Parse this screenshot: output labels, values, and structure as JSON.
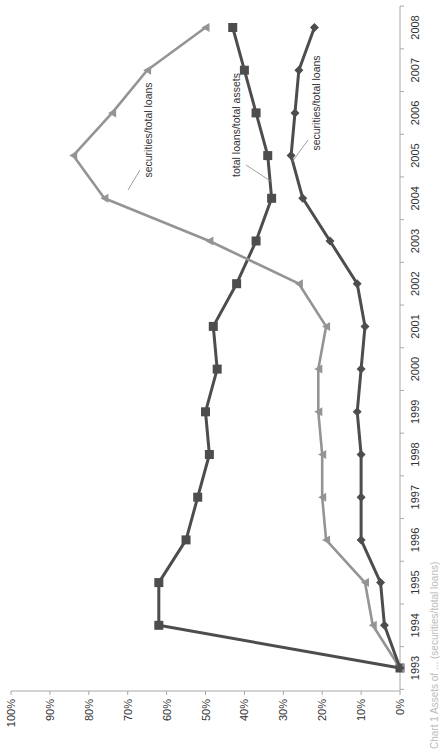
{
  "chart_data": {
    "type": "line",
    "orientation": "rotated 90 degrees counterclockwise (value axis horizontal along bottom, 0% at right; years run bottom-to-top)",
    "title": "",
    "xlabel": "",
    "ylabel": "",
    "ylim": [
      0,
      100
    ],
    "y_ticks": [
      "0%",
      "10%",
      "20%",
      "30%",
      "40%",
      "50%",
      "60%",
      "70%",
      "80%",
      "90%",
      "100%"
    ],
    "categories": [
      "1993",
      "1994",
      "1995",
      "1996",
      "1997",
      "1998",
      "1999",
      "2000",
      "2001",
      "2002",
      "2003",
      "2004",
      "2005",
      "2006",
      "2007",
      "2008"
    ],
    "grid": false,
    "legend": "none (inline callout labels)",
    "series": [
      {
        "name": "total loans/total assets",
        "marker": "square",
        "color": "#4d4d4d",
        "values": [
          0,
          62,
          62,
          55,
          52,
          49,
          50,
          47,
          48,
          42,
          37,
          33,
          34,
          37,
          40,
          43
        ]
      },
      {
        "name": "securities/total loans",
        "marker": "triangle",
        "color": "#949494",
        "values": [
          0,
          7,
          9,
          19,
          20,
          20,
          21,
          21,
          19,
          26,
          49,
          76,
          84,
          74,
          65,
          50
        ]
      },
      {
        "name": "securities/total loans",
        "marker": "diamond",
        "color": "#4d4d4d",
        "values": [
          0,
          4,
          5,
          10,
          10,
          10,
          11,
          10,
          9,
          11,
          18,
          25,
          28,
          27,
          26,
          22
        ]
      }
    ],
    "annotations": [
      {
        "text": "total loans/total assets",
        "series": 0
      },
      {
        "text": "securities/total loans",
        "series": 1
      },
      {
        "text": "securities/total loans",
        "series": 2
      }
    ]
  },
  "caption": "Chart 1 Assets of ... (securities/total loans)"
}
